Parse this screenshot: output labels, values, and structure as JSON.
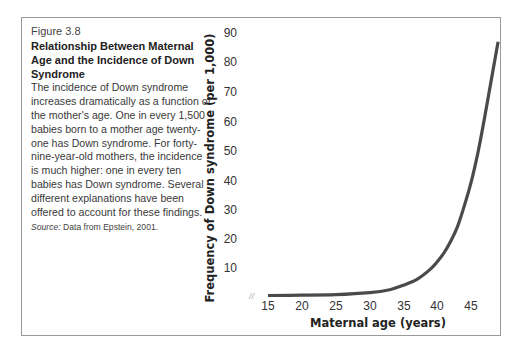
{
  "figure": {
    "number": "Figure 3.8",
    "title": "Relationship Between Maternal Age and the Incidence of Down Syndrome",
    "body": "The incidence of Down syndrome increases dramatically as a function of the mother's age. One in every 1,500 babies born to a mother age twenty-one has Down syndrome. For forty-nine-year-old mothers, the incidence is much higher: one in every ten babies has Down syndrome. Several different explanations have been offered to account for these findings.",
    "source_label": "Source:",
    "source_text": "Data from Epstein, 2001."
  },
  "chart_data": {
    "type": "line",
    "title": "",
    "xlabel": "Maternal age (years)",
    "ylabel": "Frequency of Down syndrome (per 1,000)",
    "x_ticks": [
      "15",
      "20",
      "25",
      "30",
      "35",
      "40",
      "45"
    ],
    "y_ticks": [
      "10",
      "20",
      "30",
      "40",
      "50",
      "60",
      "70",
      "80",
      "90"
    ],
    "xlim": [
      15,
      49
    ],
    "ylim": [
      0,
      90
    ],
    "axis_break_symbol": "//",
    "grid": false,
    "legend": null,
    "series": [
      {
        "name": "Frequency of Down syndrome",
        "x": [
          15,
          20,
          25,
          30,
          33,
          35,
          37,
          39,
          40,
          41,
          42,
          43,
          44,
          45,
          46,
          47,
          48,
          49
        ],
        "values": [
          0.5,
          0.6,
          0.8,
          1.5,
          2.5,
          4,
          6,
          9.5,
          12,
          15,
          19,
          24,
          31,
          39,
          49,
          61,
          74,
          87
        ]
      }
    ]
  }
}
